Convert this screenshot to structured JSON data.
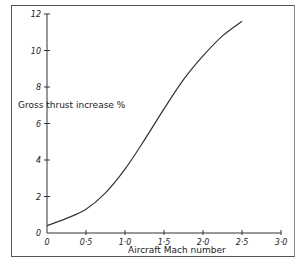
{
  "chart_data": {
    "type": "line",
    "title": "",
    "xlabel": "Aircraft Mach number",
    "ylabel": "Gross thrust increase %",
    "xlim": [
      0,
      3.0
    ],
    "ylim": [
      0,
      12
    ],
    "x_ticks": [
      "0",
      "0·5",
      "1·0",
      "1·5",
      "2·0",
      "2·5",
      "3·0"
    ],
    "y_ticks": [
      "0",
      "2",
      "4",
      "6",
      "8",
      "10",
      "12"
    ],
    "grid": false,
    "legend": null,
    "series": [
      {
        "name": "Gross thrust increase",
        "x": [
          0,
          0.25,
          0.5,
          0.75,
          1.0,
          1.25,
          1.5,
          1.75,
          2.0,
          2.25,
          2.5
        ],
        "y": [
          0.4,
          0.8,
          1.3,
          2.2,
          3.5,
          5.1,
          6.8,
          8.4,
          9.7,
          10.8,
          11.6
        ]
      }
    ]
  }
}
